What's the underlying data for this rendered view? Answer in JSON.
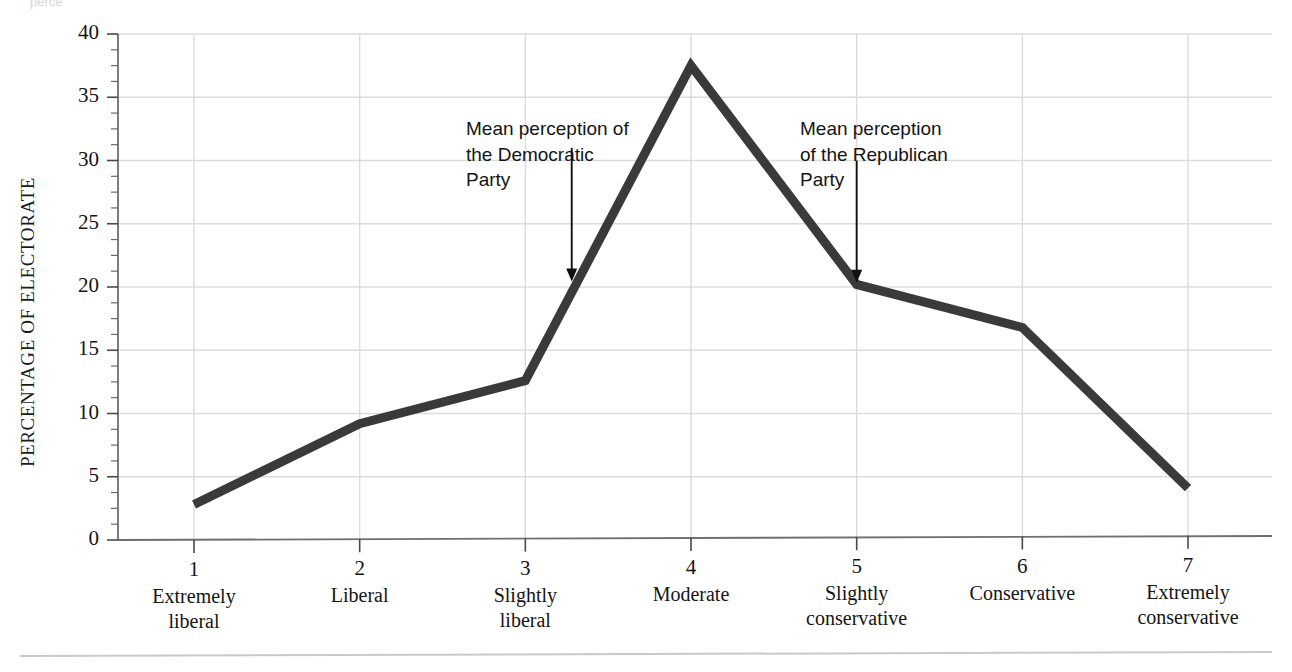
{
  "figure": {
    "background": "#ffffff",
    "line_color": "#3a3a3a",
    "grid_color": "#dcdcdc",
    "axis_color": "#808080",
    "top_partial_text": "perce"
  },
  "chart_data": {
    "type": "line",
    "title": "",
    "xlabel": "",
    "ylabel": "PERCENTAGE OF ELECTORATE",
    "xlim": [
      0.55,
      7.45
    ],
    "ylim": [
      0,
      40
    ],
    "grid": true,
    "legend": "none",
    "categories": [
      "Extremely liberal",
      "Liberal",
      "Slightly liberal",
      "Moderate",
      "Slightly conservative",
      "Conservative",
      "Extremely conservative"
    ],
    "x": [
      1,
      2,
      3,
      4,
      5,
      6,
      7
    ],
    "values": [
      2.8,
      9.2,
      12.6,
      37.5,
      20.2,
      16.8,
      4.1
    ],
    "yticks": [
      0,
      5,
      10,
      15,
      20,
      25,
      30,
      35,
      40
    ],
    "yticklabels": [
      "0",
      "5",
      "10",
      "15",
      "20",
      "25",
      "30",
      "35",
      "40"
    ],
    "yminor_step": 1.25,
    "xticklabels": [
      "1",
      "2",
      "3",
      "4",
      "5",
      "6",
      "7"
    ],
    "xtick_categories": [
      [
        "Extremely",
        "liberal"
      ],
      [
        "Liberal",
        ""
      ],
      [
        "Slightly",
        "liberal"
      ],
      [
        "Moderate",
        ""
      ],
      [
        "Slightly",
        "conservative"
      ],
      [
        "Conservative",
        ""
      ],
      [
        "Extremely",
        "conservative"
      ]
    ],
    "annotations": [
      {
        "name": "mean-perception-democratic-party",
        "text": "Mean perception of\nthe Democratic\nParty",
        "arrow_x": 3.28,
        "arrow_y_top": 31.0,
        "arrow_y_tip": 20.6
      },
      {
        "name": "mean-perception-republican-party",
        "text": "Mean perception\nof the Republican\nParty",
        "arrow_x": 5.0,
        "arrow_y_top": 30.0,
        "arrow_y_tip": 20.5
      }
    ]
  }
}
